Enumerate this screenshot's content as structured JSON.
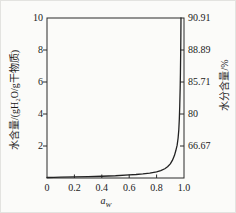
{
  "figure": {
    "background": "#fbfbf9",
    "frame_color": "#2a2a2a",
    "text_color": "#1a1a1a"
  },
  "chart_data": {
    "type": "line",
    "title": "",
    "grid": false,
    "legend": "none",
    "x_axis": {
      "label_base": "a",
      "label_sub": "W",
      "range": [
        0,
        1.0
      ],
      "ticks": [
        {
          "value": 0,
          "label": "0"
        },
        {
          "value": 0.2,
          "label": "0.2"
        },
        {
          "value": 0.4,
          "label": "0.4"
        },
        {
          "value": 0.6,
          "label": "0.6"
        },
        {
          "value": 0.8,
          "label": "0.8"
        },
        {
          "value": 1.0,
          "label": "1.0"
        }
      ]
    },
    "y_axis_left": {
      "label": "水含量/(gH₂O/g干物质)",
      "range": [
        0,
        10
      ],
      "ticks": [
        {
          "value": 2,
          "label": "2"
        },
        {
          "value": 4,
          "label": "4"
        },
        {
          "value": 6,
          "label": "6"
        },
        {
          "value": 8,
          "label": "8"
        },
        {
          "value": 10,
          "label": "10"
        }
      ]
    },
    "y_axis_right": {
      "label": "水分含量/%",
      "ticks": [
        {
          "value": 2,
          "label": "66.67"
        },
        {
          "value": 4,
          "label": "80"
        },
        {
          "value": 6,
          "label": "85.71"
        },
        {
          "value": 8,
          "label": "88.89"
        },
        {
          "value": 10,
          "label": "90.91"
        }
      ]
    },
    "series": [
      {
        "name": "sorption-isotherm",
        "color": "#222222",
        "points": [
          [
            0,
            0.03
          ],
          [
            0.05,
            0.04
          ],
          [
            0.1,
            0.05
          ],
          [
            0.2,
            0.065
          ],
          [
            0.3,
            0.085
          ],
          [
            0.4,
            0.11
          ],
          [
            0.5,
            0.14
          ],
          [
            0.6,
            0.19
          ],
          [
            0.65,
            0.22
          ],
          [
            0.7,
            0.26
          ],
          [
            0.75,
            0.31
          ],
          [
            0.8,
            0.38
          ],
          [
            0.83,
            0.46
          ],
          [
            0.86,
            0.58
          ],
          [
            0.88,
            0.7
          ],
          [
            0.9,
            0.88
          ],
          [
            0.915,
            1.1
          ],
          [
            0.93,
            1.4
          ],
          [
            0.94,
            1.7
          ],
          [
            0.95,
            2.05
          ],
          [
            0.957,
            2.5
          ],
          [
            0.962,
            3.0
          ],
          [
            0.966,
            3.7
          ],
          [
            0.969,
            4.5
          ],
          [
            0.972,
            5.6
          ],
          [
            0.974,
            6.6
          ],
          [
            0.976,
            7.9
          ],
          [
            0.977,
            8.8
          ],
          [
            0.978,
            10
          ]
        ]
      }
    ]
  }
}
